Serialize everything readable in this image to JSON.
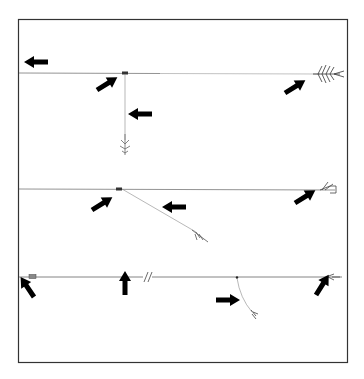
{
  "figure": {
    "title": "",
    "colors": {
      "frame": "#333333",
      "line": "#777777",
      "arrow": "#000000",
      "fly": "#555555"
    },
    "rigs": [
      {
        "name": "rig-top",
        "line_y": 73,
        "arrows": 4
      },
      {
        "name": "rig-middle",
        "line_y": 189,
        "arrows": 3
      },
      {
        "name": "rig-bottom",
        "line_y": 277,
        "arrows": 4,
        "break_mark": "//"
      }
    ]
  }
}
